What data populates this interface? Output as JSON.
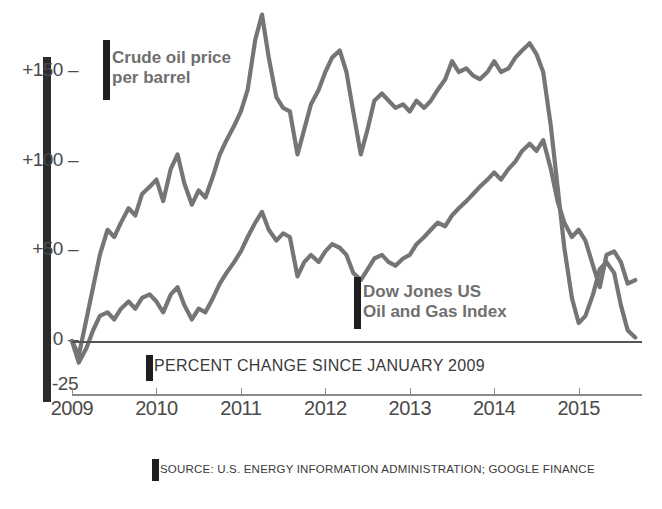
{
  "chart_data": {
    "type": "line",
    "title": "PERCENT CHANGE SINCE JANUARY 2009",
    "xlabel": "",
    "ylabel": "",
    "grid": false,
    "legend_position": "inline-annotations",
    "xlim": [
      2009,
      2015.75
    ],
    "ylim": [
      -25,
      190
    ],
    "ytick_labels": [
      "+150",
      "+100",
      "+50",
      "0",
      "-25"
    ],
    "ytick_values": [
      150,
      100,
      50,
      0,
      -25
    ],
    "xtick_labels": [
      "2009",
      "2010",
      "2011",
      "2012",
      "2013",
      "2014",
      "2015"
    ],
    "xtick_values": [
      2009,
      2010,
      2011,
      2012,
      2013,
      2014,
      2015
    ],
    "source": "SOURCE: U.S. ENERGY INFORMATION ADMINISTRATION; GOOGLE FINANCE",
    "line_color": "#757575",
    "accent_color": "#1f1f1f",
    "series": [
      {
        "name": "Crude oil price per barrel",
        "label_line1": "Crude oil price",
        "label_line2": "per barrel",
        "x": [
          2009.0,
          2009.08,
          2009.17,
          2009.25,
          2009.33,
          2009.42,
          2009.5,
          2009.58,
          2009.67,
          2009.75,
          2009.83,
          2009.92,
          2010.0,
          2010.08,
          2010.17,
          2010.25,
          2010.33,
          2010.42,
          2010.5,
          2010.58,
          2010.67,
          2010.75,
          2010.83,
          2010.92,
          2011.0,
          2011.08,
          2011.17,
          2011.25,
          2011.33,
          2011.42,
          2011.5,
          2011.58,
          2011.67,
          2011.75,
          2011.83,
          2011.92,
          2012.0,
          2012.08,
          2012.17,
          2012.25,
          2012.33,
          2012.42,
          2012.5,
          2012.58,
          2012.67,
          2012.75,
          2012.83,
          2012.92,
          2013.0,
          2013.08,
          2013.17,
          2013.25,
          2013.33,
          2013.42,
          2013.5,
          2013.58,
          2013.67,
          2013.75,
          2013.83,
          2013.92,
          2014.0,
          2014.08,
          2014.17,
          2014.25,
          2014.33,
          2014.42,
          2014.5,
          2014.58,
          2014.67,
          2014.75,
          2014.83,
          2014.92,
          2015.0,
          2015.08,
          2015.17,
          2015.25,
          2015.33,
          2015.42,
          2015.5,
          2015.58,
          2015.67
        ],
        "values": [
          0,
          -8,
          12,
          30,
          48,
          62,
          58,
          66,
          74,
          70,
          82,
          86,
          90,
          78,
          96,
          104,
          88,
          76,
          84,
          80,
          92,
          104,
          112,
          120,
          128,
          140,
          168,
          182,
          158,
          136,
          130,
          128,
          104,
          118,
          132,
          140,
          150,
          158,
          162,
          150,
          128,
          104,
          118,
          134,
          138,
          134,
          130,
          132,
          128,
          134,
          130,
          134,
          140,
          146,
          156,
          150,
          152,
          148,
          146,
          150,
          156,
          150,
          152,
          158,
          162,
          166,
          160,
          150,
          120,
          86,
          52,
          24,
          10,
          14,
          26,
          40,
          44,
          38,
          20,
          6,
          2
        ],
        "units": "percent change"
      },
      {
        "name": "Dow Jones US Oil and Gas Index",
        "label_line1": "Dow Jones US",
        "label_line2": "Oil and Gas Index",
        "x": [
          2009.0,
          2009.08,
          2009.17,
          2009.25,
          2009.33,
          2009.42,
          2009.5,
          2009.58,
          2009.67,
          2009.75,
          2009.83,
          2009.92,
          2010.0,
          2010.08,
          2010.17,
          2010.25,
          2010.33,
          2010.42,
          2010.5,
          2010.58,
          2010.67,
          2010.75,
          2010.83,
          2010.92,
          2011.0,
          2011.08,
          2011.17,
          2011.25,
          2011.33,
          2011.42,
          2011.5,
          2011.58,
          2011.67,
          2011.75,
          2011.83,
          2011.92,
          2012.0,
          2012.08,
          2012.17,
          2012.25,
          2012.33,
          2012.42,
          2012.5,
          2012.58,
          2012.67,
          2012.75,
          2012.83,
          2012.92,
          2013.0,
          2013.08,
          2013.17,
          2013.25,
          2013.33,
          2013.42,
          2013.5,
          2013.58,
          2013.67,
          2013.75,
          2013.83,
          2013.92,
          2014.0,
          2014.08,
          2014.17,
          2014.25,
          2014.33,
          2014.42,
          2014.5,
          2014.58,
          2014.67,
          2014.75,
          2014.83,
          2014.92,
          2015.0,
          2015.08,
          2015.17,
          2015.25,
          2015.33,
          2015.42,
          2015.5,
          2015.58,
          2015.67
        ],
        "values": [
          0,
          -12,
          -4,
          6,
          14,
          16,
          12,
          18,
          22,
          18,
          24,
          26,
          22,
          16,
          26,
          30,
          20,
          12,
          18,
          16,
          24,
          32,
          38,
          44,
          50,
          58,
          66,
          72,
          62,
          56,
          60,
          58,
          36,
          44,
          48,
          44,
          50,
          54,
          52,
          48,
          38,
          34,
          40,
          46,
          48,
          44,
          42,
          46,
          48,
          54,
          58,
          62,
          66,
          64,
          70,
          74,
          78,
          82,
          86,
          90,
          94,
          90,
          96,
          100,
          106,
          110,
          106,
          112,
          96,
          78,
          66,
          58,
          62,
          56,
          42,
          30,
          48,
          50,
          44,
          32,
          34
        ],
        "units": "percent change"
      }
    ]
  },
  "axis": {
    "ytick_labels": [
      "+150",
      "+100",
      "+50",
      "0",
      "-25"
    ],
    "xtick_labels": [
      "2009",
      "2010",
      "2011",
      "2012",
      "2013",
      "2014",
      "2015"
    ]
  },
  "annotations": {
    "caption": "PERCENT CHANGE SINCE JANUARY 2009",
    "source": "SOURCE: U.S. ENERGY INFORMATION ADMINISTRATION; GOOGLE FINANCE"
  }
}
